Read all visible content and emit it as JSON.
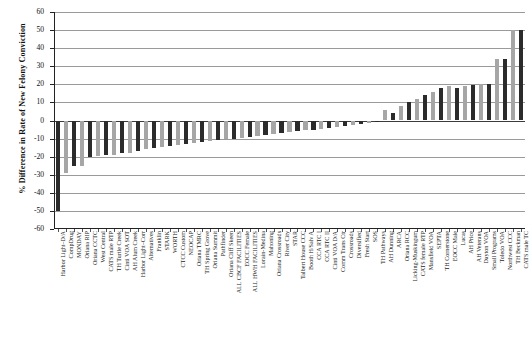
{
  "chart_data": {
    "type": "bar",
    "title": "",
    "xlabel": "",
    "ylabel": "% Difference in Rate of New Felony Conviction",
    "ylim": [
      -60,
      60
    ],
    "ytick_step": 10,
    "yticks": [
      60,
      50,
      40,
      30,
      20,
      10,
      0,
      -10,
      -20,
      -30,
      -40,
      -50,
      -60
    ],
    "grid": true,
    "legend": "none",
    "bar_colors": {
      "dark": "#2b2b2b",
      "light": "#a6a6a6"
    },
    "categories": [
      "Harbor Light–D/A",
      "CompDrug",
      "MONDAY",
      "Oriana RIP",
      "Oriana CCTC",
      "West Central",
      "CATS male RTP",
      "TH Turtle Creek",
      "Cinti VOA SOT",
      "AH Alum Creek",
      "Harbor Light–Corr",
      "Alternatives",
      "Franklin",
      "STARK",
      "WORTH",
      "CTCC Custom",
      "NEOCAP",
      "Oriana TMRC",
      "TH Spring Grove",
      "Oriana Summit",
      "Pathfinder",
      "Oriana Cliff Skeen",
      "ALL CBCF FACILITIES",
      "EOCC Female",
      "ALL HWH FACILITIES",
      "Lorain-Medina",
      "Mahoning",
      "Oriana Crossroads",
      "River City",
      "STAR",
      "Talbert House CCC",
      "Booth H/Salv A",
      "CCA RTC I",
      "CCA RTC II",
      "Cinti VOA D/A",
      "Comm Trans Ctr",
      "Crossroads",
      "Diversified",
      "Fresh Start",
      "SOS",
      "TH Pathways",
      "AH Dunning",
      "ARCA",
      "Oriana RCC",
      "Licking-Muskingum",
      "CATS female RTP",
      "Mansfield VOA",
      "SEPTA",
      "TH Cornerstone",
      "EOCC Male",
      "Lucas",
      "AH Price",
      "AH Veterans",
      "Dayton VOA",
      "Small Programs",
      "Toledo VOA",
      "Northwest CCC",
      "TH Beckman",
      "CATS male TC"
    ],
    "values": [
      -50,
      -29,
      -25,
      -25,
      -20,
      -19.5,
      -19,
      -19,
      -18,
      -18,
      -17,
      -16,
      -15,
      -14.5,
      -14,
      -13.5,
      -13,
      -12.5,
      -12,
      -11.5,
      -11,
      -10.5,
      -10,
      -9.5,
      -9,
      -8.5,
      -8,
      -7.5,
      -7,
      -6.5,
      -6,
      -5.5,
      -5,
      -4.5,
      -4,
      -3.5,
      -3,
      -2.5,
      -2,
      -1.5,
      -1,
      6,
      4,
      8,
      10,
      12,
      14,
      16,
      18,
      19,
      18,
      19,
      19.5,
      20,
      20,
      34,
      34,
      50,
      50
    ]
  }
}
